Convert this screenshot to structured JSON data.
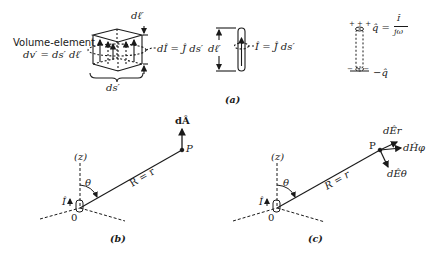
{
  "figure": {
    "panel_a": {
      "caption": "(a)",
      "volume_element": {
        "label_line1": "Volume-element",
        "label_line2": "dv′ = ds′ dℓ′",
        "height_label": "dℓ′",
        "width_label": "ds′",
        "current_label": "dÎ = Ĵ ds′"
      },
      "filament": {
        "length_label": "dℓ′",
        "current_label": "Î = Ĵ ds′"
      },
      "dipole_charges": {
        "top_charge_label": "q̂ =",
        "fraction_numerator": "Î",
        "fraction_denominator": "jω",
        "bottom_charge_label": "−q̂",
        "top_signs": "+ + +",
        "bottom_signs": "− − −"
      }
    },
    "panel_b": {
      "caption": "(b)",
      "axis_label": "(z)",
      "angle_label": "θ",
      "current_label": "Î",
      "origin_label": "0",
      "distance_label": "R = r",
      "point_label": "P",
      "vector_label": "dÂ"
    },
    "panel_c": {
      "caption": "(c)",
      "axis_label": "(z)",
      "angle_label": "θ",
      "current_label": "Î",
      "origin_label": "0",
      "distance_label": "R = r",
      "point_label": "P",
      "field_labels": {
        "E_r": "dÊr",
        "H_phi": "dĤφ",
        "E_theta": "dÊθ"
      }
    }
  }
}
